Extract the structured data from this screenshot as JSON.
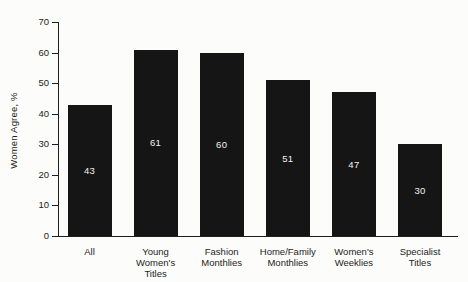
{
  "chart_data": {
    "type": "bar",
    "title": "",
    "xlabel": "",
    "ylabel": "Women Agree, %",
    "categories": [
      "All",
      "Young Women's Titles",
      "Fashion Monthlies",
      "Home/Family Monthlies",
      "Women's Weeklies",
      "Specialist Titles"
    ],
    "category_lines": [
      [
        "All"
      ],
      [
        "Young",
        "Women's",
        "Titles"
      ],
      [
        "Fashion",
        "Monthlies"
      ],
      [
        "Home/Family",
        "Monthlies"
      ],
      [
        "Women's",
        "Weeklies"
      ],
      [
        "Specialist",
        "Titles"
      ]
    ],
    "values": [
      43,
      61,
      60,
      51,
      47,
      30
    ],
    "value_labels": [
      "43",
      "61",
      "60",
      "51",
      "47",
      "30"
    ],
    "ylim": [
      0,
      70
    ],
    "yticks": [
      0,
      10,
      20,
      30,
      40,
      50,
      60,
      70
    ],
    "grid": false,
    "legend": false,
    "bar_color": "#151515",
    "value_label_color": "#f2f2f2",
    "axis_color": "#1e1e1e",
    "text_color": "#1c1c1c",
    "background_color": "#fcfcfa"
  }
}
